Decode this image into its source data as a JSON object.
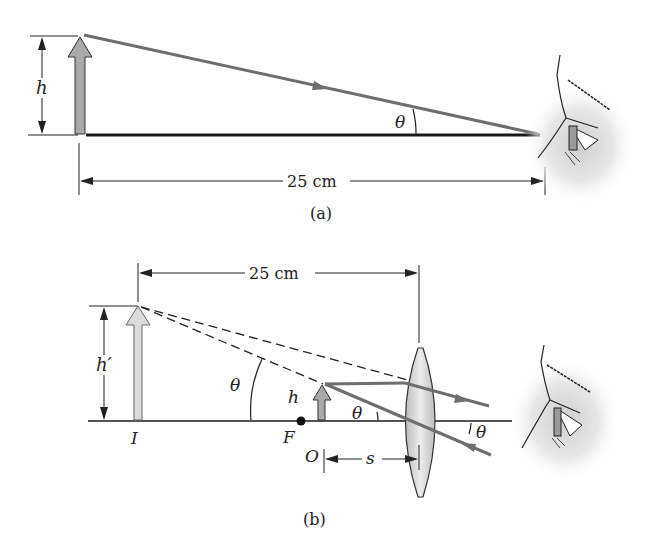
{
  "figure_a": {
    "caption": "(a)",
    "height_label": "h",
    "angle_label": "θ",
    "distance_label": "25 cm"
  },
  "figure_b": {
    "caption": "(b)",
    "distance_label": "25 cm",
    "image_height_label": "h′",
    "object_height_label": "h",
    "angle_label_image": "θ",
    "angle_label_object": "θ",
    "angle_label_exit": "θ",
    "image_label": "I",
    "focal_label": "F",
    "object_label": "O",
    "object_distance_label": "s"
  },
  "colors": {
    "ray": "#6e6e6e",
    "object_arrow_fill": "#a9a9a9",
    "image_arrow_fill": "#dcdcdc",
    "lens_fill": "#d4d4d4",
    "axis": "#1a1a1a"
  }
}
